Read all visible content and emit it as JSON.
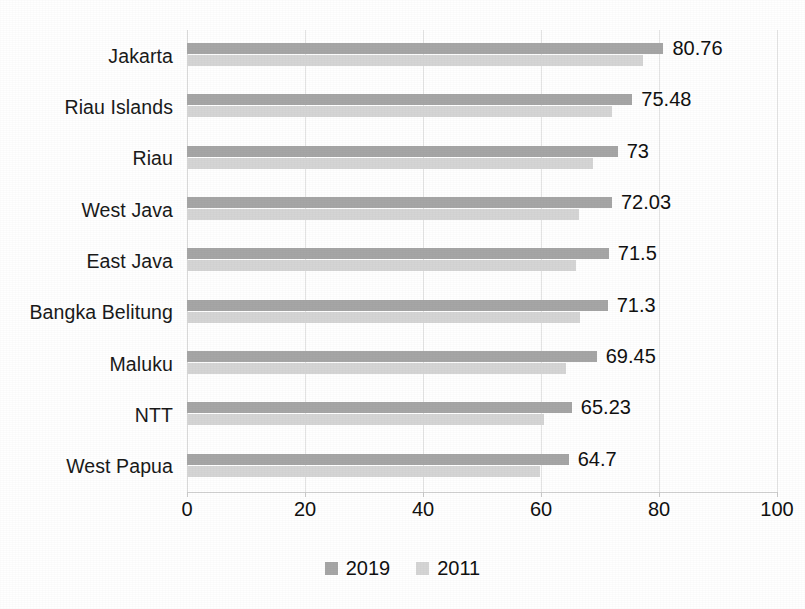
{
  "chart_data": {
    "type": "bar",
    "orientation": "horizontal",
    "title": "",
    "subtitle": "",
    "xlabel": "",
    "ylabel": "",
    "xlim": [
      0,
      100
    ],
    "xticks": [
      0,
      20,
      40,
      60,
      80,
      100
    ],
    "grid": true,
    "grid_axis": "x",
    "legend_position": "bottom",
    "categories": [
      "Jakarta",
      "Riau Islands",
      "Riau",
      "West Java",
      "East Java",
      "Bangka Belitung",
      "Maluku",
      "NTT",
      "West Papua"
    ],
    "series": [
      {
        "name": "2019",
        "color": "#a6a6a6",
        "values": [
          80.76,
          75.48,
          73,
          72.03,
          71.5,
          71.3,
          69.45,
          65.23,
          64.7
        ],
        "show_labels": true
      },
      {
        "name": "2011",
        "color": "#d5d5d5",
        "values": [
          77.3,
          72.1,
          68.8,
          66.4,
          65.9,
          66.6,
          64.2,
          60.5,
          59.9
        ],
        "show_labels": false
      }
    ],
    "data_labels": [
      "80.76",
      "75.48",
      "73",
      "72.03",
      "71.5",
      "71.3",
      "69.45",
      "65.23",
      "64.7"
    ],
    "tick_labels": [
      "0",
      "20",
      "40",
      "60",
      "80",
      "100"
    ],
    "legend": [
      {
        "label": "2019",
        "color": "#a6a6a6"
      },
      {
        "label": "2011",
        "color": "#d5d5d5"
      }
    ]
  }
}
